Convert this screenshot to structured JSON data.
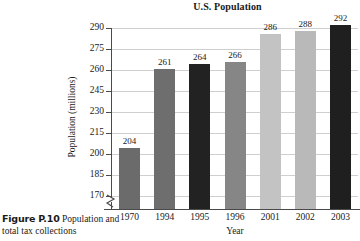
{
  "figure": {
    "caption_label": "Figure P.10",
    "caption_text": "Population and total tax collections"
  },
  "chart_data": {
    "type": "bar",
    "title": "U.S. Population",
    "xlabel": "Year",
    "ylabel": "Population (millions)",
    "categories": [
      "1970",
      "1994",
      "1995",
      "1996",
      "2001",
      "2002",
      "2003"
    ],
    "values": [
      204,
      261,
      264,
      266,
      286,
      288,
      292
    ],
    "value_labels": [
      "204",
      "261",
      "264",
      "266",
      "286",
      "288",
      "292"
    ],
    "bar_colors": [
      "#6b6b6b",
      "#6e6e6e",
      "#222222",
      "#868686",
      "#c3c3c3",
      "#b9b9b9",
      "#1f1f1f"
    ],
    "ylim": [
      170,
      290
    ],
    "yticks": [
      290,
      275,
      260,
      245,
      230,
      215,
      200,
      185,
      170
    ],
    "ytick_labels": [
      "290",
      "275",
      "260",
      "245",
      "230",
      "215",
      "200",
      "185",
      "170"
    ],
    "grid": true,
    "axis_break": true,
    "legend": null
  }
}
